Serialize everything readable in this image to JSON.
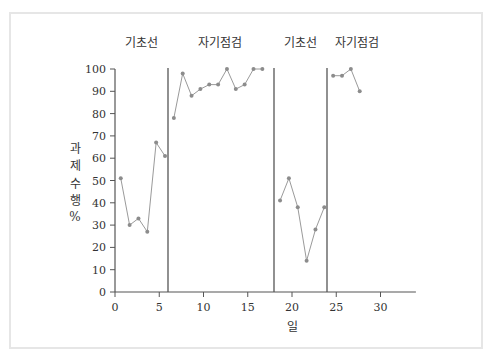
{
  "chart_data": {
    "type": "line",
    "title": "",
    "xlabel": "일",
    "ylabel": [
      "과",
      "제",
      "수",
      "행",
      "%"
    ],
    "xlim": [
      0,
      34
    ],
    "ylim": [
      0,
      100
    ],
    "xticks": [
      0,
      5,
      10,
      15,
      20,
      25,
      30
    ],
    "yticks": [
      0,
      10,
      20,
      30,
      40,
      50,
      60,
      70,
      80,
      90,
      100
    ],
    "grid": false,
    "legend": null,
    "phase_lines": [
      6,
      18,
      24
    ],
    "phases": [
      {
        "label": "기초선",
        "x": [
          1,
          2,
          3,
          4,
          5,
          6
        ],
        "values": [
          51,
          30,
          33,
          27,
          67,
          61
        ]
      },
      {
        "label": "자기점검",
        "x": [
          7,
          8,
          9,
          10,
          11,
          12,
          13,
          14,
          15,
          16,
          17
        ],
        "values": [
          78,
          98,
          88,
          91,
          93,
          93,
          100,
          91,
          93,
          100,
          100
        ]
      },
      {
        "label": "기초선",
        "x": [
          19,
          20,
          21,
          22,
          23,
          24
        ],
        "values": [
          41,
          51,
          38,
          14,
          28,
          38
        ]
      },
      {
        "label": "자기점검",
        "x": [
          25,
          26,
          27,
          28
        ],
        "values": [
          97,
          97,
          100,
          90
        ]
      }
    ],
    "colors": {
      "line": "#9a9a9a",
      "marker": "#8c8c8c",
      "axis": "#555555",
      "phase_line": "#555555"
    }
  }
}
